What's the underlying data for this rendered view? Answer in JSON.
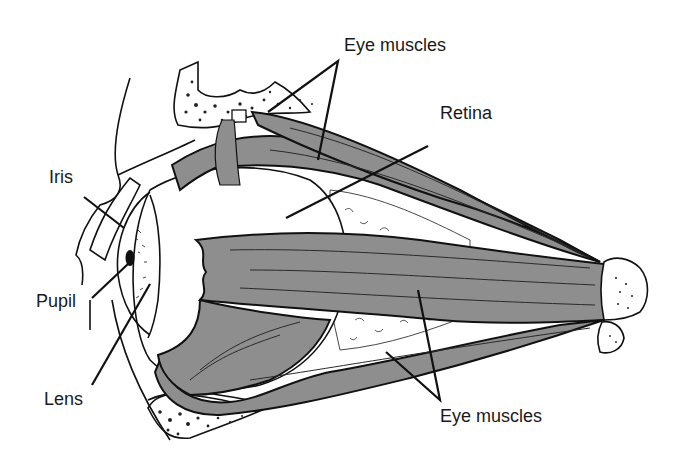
{
  "diagram": {
    "labels": {
      "eye_muscles_top": "Eye muscles",
      "retina": "Retina",
      "iris": "Iris",
      "pupil": "Pupil",
      "lens": "Lens",
      "eye_muscles_bottom": "Eye muscles"
    },
    "colors": {
      "background": "#ffffff",
      "muscle_fill": "#8e8e8e",
      "ink": "#111111"
    },
    "parts": [
      "eyeball",
      "cornea",
      "iris",
      "pupil",
      "lens",
      "retina",
      "superior muscle",
      "superior oblique muscle",
      "lateral rectus muscle",
      "inferior muscle",
      "optic nerve",
      "orbital bone",
      "eyelid"
    ]
  }
}
